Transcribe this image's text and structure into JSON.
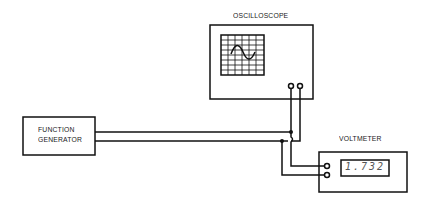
{
  "diagram": {
    "oscilloscope": {
      "label": "OSCILLOSCOPE"
    },
    "function_generator": {
      "label_line1": "FUNCTION",
      "label_line2": "GENERATOR"
    },
    "voltmeter": {
      "label": "VOLTMETER",
      "reading": "1.732"
    }
  }
}
